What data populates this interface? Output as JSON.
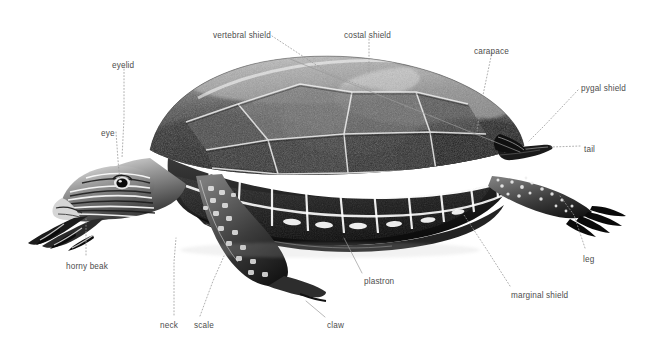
{
  "figure": {
    "style": "black-and-white photographic illustration with dotted leader lines",
    "background_color": "#ffffff",
    "label_color": "#4d4d4d",
    "leader_color": "#9a9a9a"
  },
  "labels": [
    {
      "id": "eyelid",
      "text": "eyelid",
      "x": 112,
      "y": 61,
      "anchor": "start"
    },
    {
      "id": "eye",
      "text": "eye",
      "x": 101,
      "y": 129,
      "anchor": "start"
    },
    {
      "id": "vertebral-shield",
      "text": "vertebral shield",
      "x": 213,
      "y": 31,
      "anchor": "start"
    },
    {
      "id": "costal-shield",
      "text": "costal shield",
      "x": 344,
      "y": 31,
      "anchor": "start"
    },
    {
      "id": "carapace",
      "text": "carapace",
      "x": 474,
      "y": 47,
      "anchor": "start"
    },
    {
      "id": "pygal-shield",
      "text": "pygal shield",
      "x": 581,
      "y": 84,
      "anchor": "start"
    },
    {
      "id": "tail",
      "text": "tail",
      "x": 584,
      "y": 145,
      "anchor": "start"
    },
    {
      "id": "leg",
      "text": "leg",
      "x": 583,
      "y": 255,
      "anchor": "start"
    },
    {
      "id": "marginal-shield",
      "text": "marginal shield",
      "x": 511,
      "y": 291,
      "anchor": "start"
    },
    {
      "id": "plastron",
      "text": "plastron",
      "x": 364,
      "y": 277,
      "anchor": "start"
    },
    {
      "id": "claw",
      "text": "claw",
      "x": 327,
      "y": 321,
      "anchor": "start"
    },
    {
      "id": "scale",
      "text": "scale",
      "x": 194,
      "y": 321,
      "anchor": "start"
    },
    {
      "id": "neck",
      "text": "neck",
      "x": 160,
      "y": 321,
      "anchor": "start"
    },
    {
      "id": "horny-beak",
      "text": "horny beak",
      "x": 66,
      "y": 262,
      "anchor": "start"
    }
  ],
  "leaders": [
    {
      "id": "eyelid-leader",
      "style": "dotted",
      "points": "124,66 124,118 122,158"
    },
    {
      "id": "eye-leader",
      "style": "dotted",
      "points": "116,132 118,160 120,182"
    },
    {
      "id": "vertebral-shield-leader",
      "style": "dotted",
      "points": "272,36 330,74 372,90"
    },
    {
      "id": "costal-shield-leader",
      "style": "dotted",
      "points": "369,36 369,72"
    },
    {
      "id": "carapace-leader",
      "style": "dotted",
      "points": "492,52 483,95 477,131"
    },
    {
      "id": "carapace-bracket",
      "style": "solid",
      "points": "290,59 520,152"
    },
    {
      "id": "pygal-shield-leader",
      "style": "dotted",
      "points": "578,90 545,125 529,141"
    },
    {
      "id": "tail-leader",
      "style": "dotted",
      "points": "580,146 551,147"
    },
    {
      "id": "leg-leader",
      "style": "dotted",
      "points": "585,248 574,215 560,196"
    },
    {
      "id": "marginal-shield-leader",
      "style": "dotted",
      "points": "510,286 487,250 464,215"
    },
    {
      "id": "plastron-leader",
      "style": "solid",
      "points": "362,273 344,238"
    },
    {
      "id": "claw-leader",
      "style": "solid",
      "points": "325,317 306,301"
    },
    {
      "id": "scale-leader",
      "style": "dotted",
      "points": "200,316 213,281 224,256"
    },
    {
      "id": "neck-leader",
      "style": "dotted",
      "points": "174,315 174,262 176,238"
    },
    {
      "id": "horny-beak-leader",
      "style": "dotted",
      "points": "86,255 86,232 86,219"
    }
  ],
  "anatomy_parts": [
    "eyelid",
    "eye",
    "vertebral shield",
    "costal shield",
    "carapace",
    "pygal shield",
    "tail",
    "leg",
    "marginal shield",
    "plastron",
    "claw",
    "scale",
    "neck",
    "horny beak"
  ]
}
